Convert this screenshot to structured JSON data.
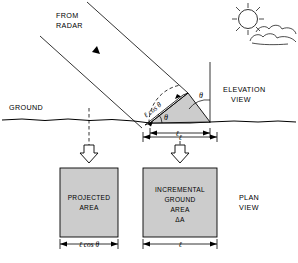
{
  "figure": {
    "background_color": "#ffffff",
    "ink_color": "#000000",
    "fill_gray": "#cccccc"
  },
  "elevation": {
    "view_label_line1": "ELEVATION",
    "view_label_line2": "VIEW",
    "radar_label_line1": "FROM",
    "radar_label_line2": "RADAR",
    "ground_label": "GROUND",
    "slope_dimension": "ℓ cos θ",
    "base_dimension": "ℓ",
    "angle_symbol_slope": "θ",
    "angle_symbol_vertical": "θ",
    "sun_icon": "sun-icon",
    "cloud_icon": "cloud-icon",
    "beam_arrow_icon": "beam-direction-arrow-icon"
  },
  "plan": {
    "view_label_line1": "PLAN",
    "view_label_line2": "VIEW",
    "projected_box": {
      "line1": "PROJECTED",
      "line2": "AREA",
      "dimension": "ℓ cos θ"
    },
    "incremental_box": {
      "line1": "INCREMENTAL",
      "line2": "GROUND",
      "line3": "AREA",
      "line4": "ΔA",
      "dimension": "ℓ"
    },
    "projection_arrow_left_icon": "down-block-arrow-icon",
    "projection_arrow_right_icon": "down-block-arrow-icon"
  }
}
